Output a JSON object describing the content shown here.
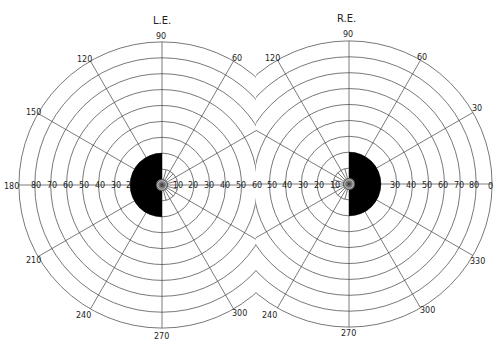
{
  "figure": {
    "type": "visual field perimetry chart",
    "left_eye": {
      "title": "L.E.",
      "meridian_labels": [
        "90",
        "60",
        "120",
        "150",
        "180",
        "210",
        "240",
        "270",
        "300"
      ],
      "eccentricity_labels": [
        "80",
        "70",
        "60",
        "50",
        "40",
        "30",
        "2",
        "10",
        "20",
        "30",
        "40",
        "50",
        "60"
      ],
      "defect": "dense temporal (left-half) field loss from ~2° to ~25°, central sparing"
    },
    "right_eye": {
      "title": "R.E.",
      "meridian_labels": [
        "90",
        "60",
        "30",
        "0",
        "120",
        "330",
        "300",
        "270",
        "240"
      ],
      "eccentricity_labels": [
        "60",
        "50",
        "40",
        "30",
        "20",
        "10",
        "30",
        "40",
        "50",
        "60",
        "70",
        "80"
      ],
      "defect": "dense temporal (right-half) field loss from ~2° to ~25°, central sparing"
    },
    "rings_degrees": [
      10,
      20,
      30,
      40,
      50,
      60,
      70,
      80,
      90
    ],
    "colors": {
      "lines": "#555555",
      "defect": "#000000",
      "background": "#ffffff"
    }
  }
}
